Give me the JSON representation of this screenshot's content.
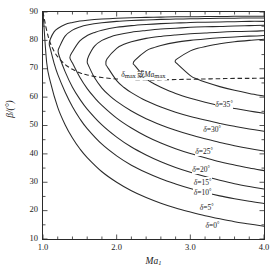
{
  "figure": {
    "background": "#ffffff",
    "line_color": "#2a2a2a"
  },
  "axes": {
    "x_title_main": "Ma",
    "x_title_sub": "1",
    "y_title": "β/(°)",
    "x_ticks": [
      "1.0",
      "2.0",
      "3.0",
      "4.0"
    ],
    "x_tick_values": [
      1.0,
      2.0,
      3.0,
      4.0
    ],
    "y_ticks": [
      "10",
      "20",
      "30",
      "40",
      "50",
      "60",
      "70",
      "80",
      "90"
    ],
    "y_tick_values": [
      10,
      20,
      30,
      40,
      50,
      60,
      70,
      80,
      90
    ],
    "xlim": [
      1.0,
      4.0
    ],
    "ylim": [
      10,
      90
    ],
    "x_minor_step": 0.2,
    "y_minor_step": 5,
    "grid": false,
    "ticks_direction": "in"
  },
  "annotations": {
    "max_curve_label": "δmax 或 Mamax",
    "max_curve_label_parts": {
      "delta": "δ",
      "sub1": "max",
      "conj": "或",
      "ma": "Ma",
      "sub2": "max"
    },
    "max_curve_label_x": 2.4,
    "max_curve_label_y": 67.5
  },
  "curve_labels": [
    {
      "text": "δ=35°",
      "delta": "δ=",
      "value": "35",
      "unit": "°",
      "x": 3.33,
      "y": 58.0
    },
    {
      "text": "δ=30°",
      "delta": "δ=",
      "value": "30",
      "unit": "°",
      "x": 3.17,
      "y": 49.0
    },
    {
      "text": "δ=25°",
      "delta": "δ=",
      "value": "25",
      "unit": "°",
      "x": 3.06,
      "y": 41.5
    },
    {
      "text": "δ=20°",
      "delta": "δ=",
      "value": "20",
      "unit": "°",
      "x": 3.02,
      "y": 35.0
    },
    {
      "text": "δ=15°",
      "delta": "δ=",
      "value": "15",
      "unit": "°",
      "x": 3.04,
      "y": 30.3
    },
    {
      "text": "δ=10°",
      "delta": "δ=",
      "value": "10",
      "unit": "°",
      "x": 3.04,
      "y": 27.0
    },
    {
      "text": "δ=5°",
      "delta": "δ=",
      "value": "5",
      "unit": "°",
      "x": 3.12,
      "y": 21.8
    },
    {
      "text": "δ=0°",
      "delta": "δ=",
      "value": "0",
      "unit": "°",
      "x": 3.2,
      "y": 15.3
    }
  ],
  "chart_data": {
    "type": "line",
    "title": "",
    "xlabel": "Ma1",
    "ylabel": "β/(°)",
    "xlim": [
      1.0,
      4.0
    ],
    "ylim": [
      10,
      90
    ],
    "grid": false,
    "legend": "inline curve labels",
    "series": [
      {
        "name": "δ=0°",
        "delta_deg": 0,
        "x": [
          1.0,
          1.05,
          1.1,
          1.2,
          1.3,
          1.4,
          1.5,
          1.6,
          1.8,
          2.0,
          2.2,
          2.4,
          2.6,
          2.8,
          3.0,
          3.2,
          3.4,
          3.6,
          3.8,
          4.0
        ],
        "y": [
          90.0,
          72.2,
          65.4,
          56.4,
          50.3,
          45.6,
          41.8,
          38.7,
          33.7,
          30.0,
          27.0,
          24.6,
          22.6,
          20.9,
          19.5,
          18.2,
          17.1,
          16.1,
          15.3,
          14.5
        ]
      },
      {
        "name": "δ=5°",
        "delta_deg": 5,
        "branch_weak": {
          "x": [
            1.1,
            1.15,
            1.2,
            1.3,
            1.4,
            1.5,
            1.6,
            1.8,
            2.0,
            2.2,
            2.4,
            2.6,
            2.8,
            3.0,
            3.2,
            3.4,
            3.6,
            3.8,
            4.0
          ],
          "y": [
            77.0,
            72.0,
            68.0,
            61.8,
            56.6,
            52.4,
            48.9,
            43.4,
            39.3,
            36.0,
            33.4,
            31.2,
            29.4,
            27.8,
            26.4,
            25.2,
            24.2,
            23.3,
            22.5
          ]
        },
        "branch_strong": {
          "x": [
            1.1,
            1.15,
            1.2,
            1.3,
            1.4,
            1.5,
            1.6,
            1.8,
            2.0,
            2.2,
            2.4,
            2.6,
            2.8,
            3.0,
            3.2,
            3.4,
            3.6,
            3.8,
            4.0
          ],
          "y": [
            80.5,
            83.0,
            84.2,
            85.6,
            86.3,
            86.8,
            87.1,
            87.5,
            87.8,
            88.0,
            88.1,
            88.2,
            88.3,
            88.3,
            88.4,
            88.4,
            88.5,
            88.5,
            88.5
          ]
        },
        "nose": {
          "x": 1.085,
          "y": 78.7
        }
      },
      {
        "name": "δ=10°",
        "delta_deg": 10,
        "branch_weak": {
          "x": [
            1.22,
            1.3,
            1.4,
            1.5,
            1.6,
            1.8,
            2.0,
            2.2,
            2.4,
            2.6,
            2.8,
            3.0,
            3.2,
            3.4,
            3.6,
            3.8,
            4.0
          ],
          "y": [
            74.5,
            69.0,
            63.5,
            59.3,
            55.8,
            50.2,
            45.9,
            42.4,
            39.6,
            37.2,
            35.2,
            33.5,
            32.0,
            30.7,
            29.5,
            28.5,
            27.6
          ]
        },
        "branch_strong": {
          "x": [
            1.22,
            1.3,
            1.4,
            1.5,
            1.6,
            1.8,
            2.0,
            2.2,
            2.4,
            2.6,
            2.8,
            3.0,
            3.2,
            3.4,
            3.6,
            3.8,
            4.0
          ],
          "y": [
            77.5,
            81.5,
            83.6,
            84.7,
            85.4,
            86.2,
            86.7,
            87.0,
            87.2,
            87.4,
            87.5,
            87.6,
            87.7,
            87.8,
            87.8,
            87.9,
            87.9
          ]
        },
        "nose": {
          "x": 1.205,
          "y": 76.2
        }
      },
      {
        "name": "δ=15°",
        "delta_deg": 15,
        "branch_weak": {
          "x": [
            1.4,
            1.5,
            1.6,
            1.7,
            1.8,
            2.0,
            2.2,
            2.4,
            2.6,
            2.8,
            3.0,
            3.2,
            3.4,
            3.6,
            3.8,
            4.0
          ],
          "y": [
            72.0,
            67.0,
            63.0,
            59.8,
            57.1,
            52.6,
            49.1,
            46.2,
            43.8,
            41.8,
            40.1,
            38.6,
            37.2,
            36.1,
            35.0,
            34.1
          ]
        },
        "branch_strong": {
          "x": [
            1.4,
            1.5,
            1.6,
            1.7,
            1.8,
            2.0,
            2.2,
            2.4,
            2.6,
            2.8,
            3.0,
            3.2,
            3.4,
            3.6,
            3.8,
            4.0
          ],
          "y": [
            76.0,
            79.8,
            81.7,
            82.8,
            83.6,
            84.6,
            85.2,
            85.6,
            85.9,
            86.1,
            86.3,
            86.4,
            86.5,
            86.6,
            86.7,
            86.7
          ]
        },
        "nose": {
          "x": 1.365,
          "y": 74.0
        }
      },
      {
        "name": "δ=20°",
        "delta_deg": 20,
        "branch_weak": {
          "x": [
            1.62,
            1.7,
            1.8,
            1.9,
            2.0,
            2.2,
            2.4,
            2.6,
            2.8,
            3.0,
            3.2,
            3.4,
            3.6,
            3.8,
            4.0
          ],
          "y": [
            71.0,
            66.8,
            63.2,
            60.6,
            58.5,
            55.1,
            52.4,
            50.2,
            48.3,
            46.7,
            45.3,
            44.0,
            42.9,
            41.9,
            41.0
          ]
        },
        "branch_strong": {
          "x": [
            1.62,
            1.7,
            1.8,
            1.9,
            2.0,
            2.2,
            2.4,
            2.6,
            2.8,
            3.0,
            3.2,
            3.4,
            3.6,
            3.8,
            4.0
          ],
          "y": [
            74.5,
            78.0,
            80.0,
            81.1,
            81.9,
            82.9,
            83.5,
            84.0,
            84.3,
            84.6,
            84.8,
            84.9,
            85.1,
            85.2,
            85.3
          ]
        },
        "nose": {
          "x": 1.6,
          "y": 72.5
        }
      },
      {
        "name": "δ=25°",
        "delta_deg": 25,
        "branch_weak": {
          "x": [
            1.87,
            2.0,
            2.1,
            2.2,
            2.4,
            2.6,
            2.8,
            3.0,
            3.2,
            3.4,
            3.6,
            3.8,
            4.0
          ],
          "y": [
            70.8,
            65.8,
            63.4,
            61.6,
            58.7,
            56.5,
            54.7,
            53.2,
            51.9,
            50.7,
            49.7,
            48.8,
            48.0
          ]
        },
        "branch_strong": {
          "x": [
            1.87,
            2.0,
            2.1,
            2.2,
            2.4,
            2.6,
            2.8,
            3.0,
            3.2,
            3.4,
            3.6,
            3.8,
            4.0
          ],
          "y": [
            73.5,
            77.2,
            78.6,
            79.5,
            80.7,
            81.4,
            81.9,
            82.3,
            82.6,
            82.9,
            83.1,
            83.2,
            83.4
          ]
        },
        "nose": {
          "x": 1.855,
          "y": 71.5
        }
      },
      {
        "name": "δ=30°",
        "delta_deg": 30,
        "branch_weak": {
          "x": [
            2.25,
            2.4,
            2.5,
            2.6,
            2.8,
            3.0,
            3.2,
            3.4,
            3.6,
            3.8,
            4.0
          ],
          "y": [
            71.0,
            66.5,
            64.8,
            63.5,
            61.3,
            59.6,
            58.2,
            57.0,
            56.0,
            55.1,
            54.3
          ]
        },
        "branch_strong": {
          "x": [
            2.25,
            2.4,
            2.5,
            2.6,
            2.8,
            3.0,
            3.2,
            3.4,
            3.6,
            3.8,
            4.0
          ],
          "y": [
            73.0,
            76.3,
            77.4,
            78.2,
            79.3,
            80.0,
            80.5,
            80.9,
            81.2,
            81.5,
            81.7
          ]
        },
        "nose": {
          "x": 2.225,
          "y": 71.8
        }
      },
      {
        "name": "δ=35°",
        "delta_deg": 35,
        "branch_weak": {
          "x": [
            2.82,
            3.0,
            3.1,
            3.2,
            3.4,
            3.6,
            3.8,
            4.0
          ],
          "y": [
            71.8,
            67.6,
            66.3,
            65.3,
            63.7,
            62.4,
            61.3,
            60.4
          ]
        },
        "branch_strong": {
          "x": [
            2.82,
            3.0,
            3.1,
            3.2,
            3.4,
            3.6,
            3.8,
            4.0
          ],
          "y": [
            73.5,
            76.3,
            77.2,
            77.8,
            78.8,
            79.5,
            80.0,
            80.4
          ]
        },
        "nose": {
          "x": 2.795,
          "y": 72.6
        }
      },
      {
        "name": "δmax",
        "style": "dashed",
        "is_max_locus": true,
        "x": [
          1.0,
          1.05,
          1.1,
          1.15,
          1.2,
          1.3,
          1.4,
          1.5,
          1.6,
          1.8,
          2.0,
          2.2,
          2.4,
          2.6,
          2.8,
          3.0,
          3.2,
          3.4,
          3.6,
          3.8,
          4.0
        ],
        "y": [
          90.0,
          83.5,
          79.0,
          76.2,
          74.2,
          71.5,
          69.8,
          68.6,
          67.8,
          66.9,
          66.4,
          66.2,
          66.1,
          66.1,
          66.2,
          66.3,
          66.4,
          66.5,
          66.6,
          66.6,
          66.7
        ]
      }
    ]
  }
}
